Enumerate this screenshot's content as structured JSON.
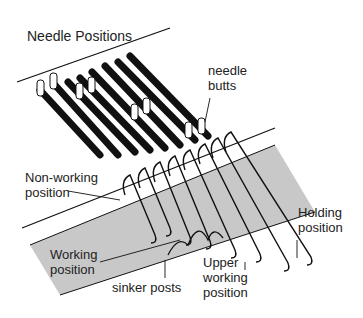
{
  "title": "Needle Positions",
  "labels": {
    "needle_butts": [
      "needle",
      "butts"
    ],
    "non_working": [
      "Non-working",
      "position"
    ],
    "working": [
      "Working",
      "position"
    ],
    "sinker_posts": "sinker posts",
    "upper_working": [
      "Upper",
      "working",
      "position"
    ],
    "holding": [
      "Holding",
      "position"
    ]
  },
  "colors": {
    "band": "#c8c8c8",
    "ink": "#111111",
    "needle": "#ffffff"
  }
}
